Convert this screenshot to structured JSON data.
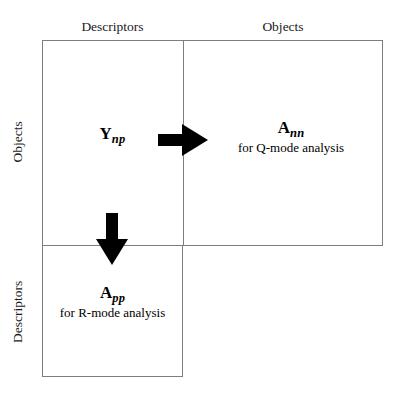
{
  "figure": {
    "background_color": "#ffffff",
    "line_color": "#7d7d7d",
    "arrow_color": "#000000"
  },
  "headers": {
    "column_left": "Descriptors",
    "column_right": "Objects",
    "row_top": "Objects",
    "row_bottom": "Descriptors"
  },
  "cells": {
    "source": {
      "matrix_base": "Y",
      "matrix_subscript": "np",
      "caption": ""
    },
    "q_mode": {
      "matrix_base": "A",
      "matrix_subscript": "nn",
      "caption": "for Q-mode analysis"
    },
    "r_mode": {
      "matrix_base": "A",
      "matrix_subscript": "pp",
      "caption": "for R-mode analysis"
    }
  },
  "arrows": {
    "to_q_mode": "arrow-right",
    "to_r_mode": "arrow-down"
  }
}
